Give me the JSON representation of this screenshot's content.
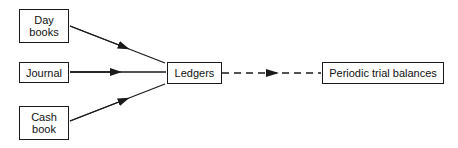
{
  "diagram": {
    "type": "flow",
    "nodes": [
      {
        "id": "day_books",
        "label": "Day\nbooks"
      },
      {
        "id": "journal",
        "label": "Journal"
      },
      {
        "id": "cash_book",
        "label": "Cash\nbook"
      },
      {
        "id": "ledgers",
        "label": "Ledgers"
      },
      {
        "id": "trial_balances",
        "label": "Periodic trial balances"
      }
    ],
    "edges": [
      {
        "from": "day_books",
        "to": "ledgers",
        "style": "solid"
      },
      {
        "from": "journal",
        "to": "ledgers",
        "style": "solid"
      },
      {
        "from": "cash_book",
        "to": "ledgers",
        "style": "solid"
      },
      {
        "from": "ledgers",
        "to": "trial_balances",
        "style": "dashed"
      }
    ]
  },
  "colors": {
    "stroke": "#1a1a1a",
    "background": "#ffffff"
  }
}
